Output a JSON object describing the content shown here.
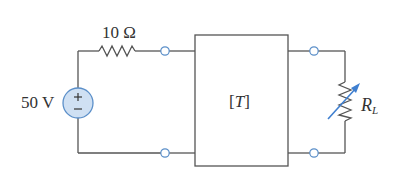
{
  "diagram": {
    "type": "circuit",
    "source": {
      "label": "50 V",
      "kind": "independent-voltage-source",
      "polarity_top": "+",
      "polarity_bottom": "−"
    },
    "series_resistor": {
      "label": "10 Ω"
    },
    "two_port": {
      "label_open": "[",
      "label_var": "T",
      "label_close": "]"
    },
    "load": {
      "label_main": "R",
      "label_sub": "L",
      "kind": "variable-resistor"
    },
    "colors": {
      "wire": "#555555",
      "source_fill": "#cfe0f3",
      "source_stroke": "#5b8fc9",
      "terminal_stroke": "#5b8fc9",
      "arrow": "#3f7fd0"
    }
  }
}
